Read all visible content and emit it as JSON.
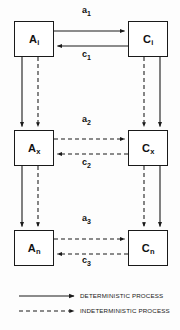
{
  "diagram": {
    "nodes": [
      {
        "id": "A_i",
        "base": "A",
        "sub": "i",
        "x": 14,
        "y": 21,
        "w": 40,
        "h": 36
      },
      {
        "id": "C_i",
        "base": "C",
        "sub": "i",
        "x": 128,
        "y": 21,
        "w": 40,
        "h": 36
      },
      {
        "id": "A_x",
        "base": "A",
        "sub": "x",
        "x": 14,
        "y": 130,
        "w": 40,
        "h": 36
      },
      {
        "id": "C_x",
        "base": "C",
        "sub": "x",
        "x": 128,
        "y": 130,
        "w": 40,
        "h": 36
      },
      {
        "id": "A_n",
        "base": "A",
        "sub": "n",
        "x": 14,
        "y": 230,
        "w": 40,
        "h": 36
      },
      {
        "id": "C_n",
        "base": "C",
        "sub": "n",
        "x": 128,
        "y": 230,
        "w": 40,
        "h": 36
      }
    ],
    "edge_labels": [
      {
        "id": "a1",
        "base": "a",
        "sub": "1",
        "x": 82,
        "y": 8,
        "kind": "deterministic"
      },
      {
        "id": "c1",
        "base": "c",
        "sub": "1",
        "x": 82,
        "y": 51,
        "kind": "deterministic"
      },
      {
        "id": "a2",
        "base": "a",
        "sub": "2",
        "x": 82,
        "y": 116,
        "kind": "indeterministic"
      },
      {
        "id": "c2",
        "base": "c",
        "sub": "2",
        "x": 82,
        "y": 159,
        "kind": "indeterministic"
      },
      {
        "id": "a3",
        "base": "a",
        "sub": "3",
        "x": 82,
        "y": 215,
        "kind": "indeterministic"
      },
      {
        "id": "c3",
        "base": "c",
        "sub": "3",
        "x": 82,
        "y": 257,
        "kind": "indeterministic"
      }
    ],
    "legend": {
      "items": [
        {
          "id": "deterministic",
          "label": "DETERMINISTIC PROCESS",
          "style": "solid"
        },
        {
          "id": "indeterministic",
          "label": "INDETERMINISTIC PROCESS",
          "style": "dashed"
        }
      ]
    },
    "colors": {
      "stroke": "#1a1a1a",
      "box_fill": "#ffffff",
      "background": "#fdfdfd",
      "text": "#111111"
    }
  }
}
